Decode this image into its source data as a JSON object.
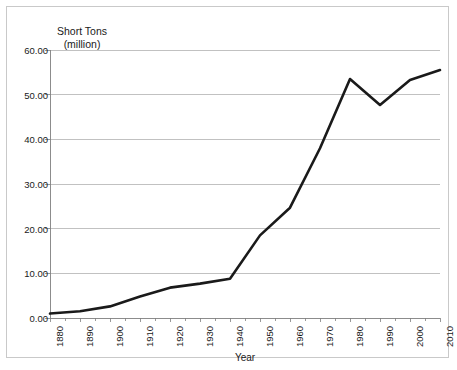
{
  "figure": {
    "background_color": "#ffffff",
    "frame_color": "#c9c9c9",
    "line_color": "#1a1a1a",
    "grid_color": "#a6a6a6"
  },
  "chart_data": {
    "type": "line",
    "title": "",
    "ylabel_line1": "Short Tons",
    "ylabel_line2": "(million)",
    "xlabel": "Year",
    "xlim": [
      1880,
      2010
    ],
    "ylim": [
      0,
      60
    ],
    "grid": "horizontal",
    "legend": "none",
    "ytick_labels": [
      "60.00",
      "50.00",
      "40.00",
      "30.00",
      "20.00",
      "10.00",
      "0.00"
    ],
    "ytick_values": [
      60,
      50,
      40,
      30,
      20,
      10,
      0
    ],
    "xtick_labels": [
      "1880",
      "1890",
      "1900",
      "1910",
      "1920",
      "1930",
      "1940",
      "1950",
      "1960",
      "1970",
      "1980",
      "1990",
      "2000",
      "2010"
    ],
    "x": [
      1880,
      1890,
      1900,
      1910,
      1920,
      1930,
      1940,
      1950,
      1960,
      1970,
      1980,
      1990,
      2000,
      2010
    ],
    "values": [
      1.0,
      1.5,
      2.6,
      4.8,
      6.8,
      7.7,
      8.8,
      18.5,
      24.7,
      38.0,
      53.5,
      47.7,
      53.3,
      55.5
    ],
    "series": [
      {
        "name": "Short Tons (million)",
        "values": [
          1.0,
          1.5,
          2.6,
          4.8,
          6.8,
          7.7,
          8.8,
          18.5,
          24.7,
          38.0,
          53.5,
          47.7,
          53.3,
          55.5
        ]
      }
    ]
  }
}
